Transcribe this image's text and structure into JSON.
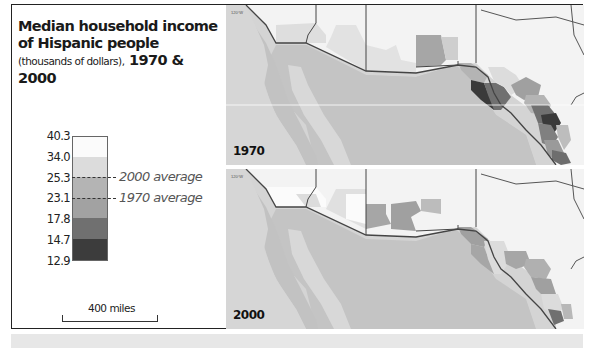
{
  "title": {
    "line1": "Median household income",
    "line2": "of Hispanic people",
    "subtitle": "(thousands of dollars),",
    "years": " 1970 & 2000"
  },
  "legend": {
    "ticks": [
      "40.3",
      "34.0",
      "25.3",
      "23.1",
      "17.8",
      "14.7",
      "12.9"
    ],
    "classes": [
      {
        "range": "34.0–40.3",
        "color": "#fbfbfb"
      },
      {
        "range": "25.3–34.0",
        "color": "#dcdcdc"
      },
      {
        "range": "23.1–25.3",
        "color": "#b2b2b2"
      },
      {
        "range": "17.8–23.1",
        "color": "#a0a0a0"
      },
      {
        "range": "14.7–17.8",
        "color": "#6e6e6e"
      },
      {
        "range": "12.9–14.7",
        "color": "#3a3a3a"
      }
    ],
    "averages": [
      {
        "label": "2000 average",
        "value": "25.3"
      },
      {
        "label": "1970 average",
        "value": "23.1"
      }
    ]
  },
  "scale_bar": {
    "label": "400 miles"
  },
  "maps": [
    {
      "year": "1970",
      "meridian_label": "120°W"
    },
    {
      "year": "2000",
      "meridian_label": "120°W"
    }
  ],
  "colors": {
    "land_other": "#f4f4f4",
    "mexico": "#c4c4c4",
    "ocean": "#d2d2d2",
    "border": "#444444"
  }
}
